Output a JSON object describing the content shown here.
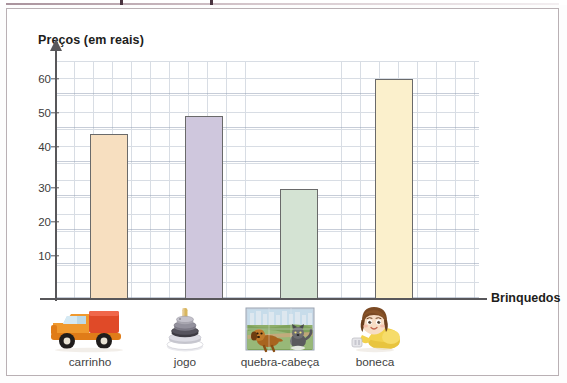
{
  "chart_data": {
    "type": "bar",
    "title": "",
    "ylabel": "Preços (em reais)",
    "xlabel": "Brinquedos",
    "categories": [
      "carrinho",
      "jogo",
      "quebra-cabeça",
      "boneca"
    ],
    "values": [
      45,
      50,
      30,
      60
    ],
    "ylim": [
      0,
      65
    ],
    "yticks": [
      10,
      20,
      30,
      40,
      50,
      60
    ],
    "ytick_labels": [
      "10",
      "20",
      "30",
      "40",
      "50",
      "60"
    ],
    "grid": true,
    "legend": "none",
    "bar_colors": [
      "#f7dfc0",
      "#cfc7dd",
      "#d4e3d3",
      "#fbf0cc"
    ],
    "bar_border_color": "#6a6a6a",
    "grid_color": "#a9b4c4",
    "axis_color": "#58575a"
  },
  "axes": {
    "y_caption": "Preços (em reais)",
    "x_caption": "Brinquedos"
  },
  "categories": [
    {
      "label": "carrinho",
      "value": 45,
      "color": "#f7dfc0",
      "icon": "toy-truck-icon"
    },
    {
      "label": "jogo",
      "value": 50,
      "color": "#cfc7dd",
      "icon": "stacking-rings-icon"
    },
    {
      "label": "quebra-cabeça",
      "value": 30,
      "color": "#d4e3d3",
      "icon": "jigsaw-puzzle-icon"
    },
    {
      "label": "boneca",
      "value": 60,
      "color": "#fbf0cc",
      "icon": "doll-icon"
    }
  ],
  "yticks": [
    {
      "label": "60",
      "value": 60
    },
    {
      "label": "50",
      "value": 50
    },
    {
      "label": "40",
      "value": 40
    },
    {
      "label": "30",
      "value": 30
    },
    {
      "label": "20",
      "value": 20
    },
    {
      "label": "10",
      "value": 10
    }
  ]
}
